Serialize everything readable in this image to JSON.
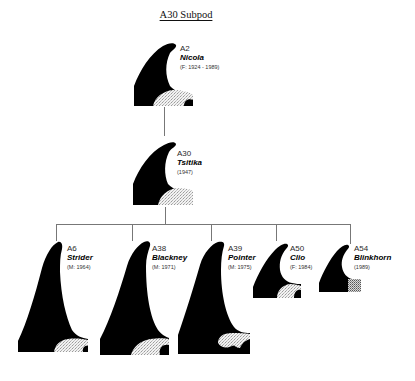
{
  "diagram": {
    "title": "A30 Subpod",
    "colors": {
      "fin": "#000000",
      "saddle": "#e8e8e8",
      "line": "#777777",
      "background": "#ffffff"
    },
    "nodes": {
      "a2": {
        "id": "A2",
        "name": "Nicola",
        "meta": "(F: 1924 - 1989)",
        "generation": 1
      },
      "a30": {
        "id": "A30",
        "name": "Tsitika",
        "meta": "(1947)",
        "generation": 2
      },
      "a6": {
        "id": "A6",
        "name": "Strider",
        "meta": "(M: 1964)",
        "generation": 3
      },
      "a38": {
        "id": "A38",
        "name": "Blackney",
        "meta": "(M: 1971)",
        "generation": 3
      },
      "a39": {
        "id": "A39",
        "name": "Pointer",
        "meta": "(M: 1975)",
        "generation": 3
      },
      "a50": {
        "id": "A50",
        "name": "Clio",
        "meta": "(F: 1984)",
        "generation": 3
      },
      "a54": {
        "id": "A54",
        "name": "Blinkhorn",
        "meta": "(1989)",
        "generation": 3
      }
    },
    "edges": [
      {
        "from": "A2",
        "to": "A30"
      },
      {
        "from": "A30",
        "to": "A6"
      },
      {
        "from": "A30",
        "to": "A38"
      },
      {
        "from": "A30",
        "to": "A39"
      },
      {
        "from": "A30",
        "to": "A50"
      },
      {
        "from": "A30",
        "to": "A54"
      }
    ],
    "icons": {
      "node_glyph": "dorsal-fin-icon",
      "saddle": "saddle-patch"
    }
  }
}
